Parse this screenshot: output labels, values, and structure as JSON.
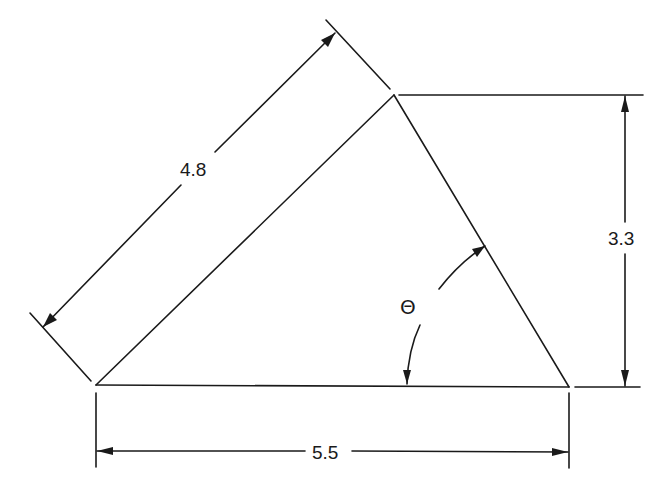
{
  "diagram": {
    "type": "triangle-dimension-drawing",
    "vertices": {
      "A": {
        "x": 96,
        "y": 385
      },
      "B": {
        "x": 394,
        "y": 95
      },
      "C": {
        "x": 569,
        "y": 387
      }
    },
    "dimensions": {
      "slant_side": {
        "label": "4.8",
        "between": [
          "A",
          "B"
        ]
      },
      "height": {
        "label": "3.3",
        "between": [
          "B",
          "base"
        ]
      },
      "base": {
        "label": "5.5",
        "between": [
          "A",
          "C"
        ]
      }
    },
    "angle": {
      "label": "Θ",
      "description": "angle between base AC and side BC",
      "vertex": "C"
    },
    "colors": {
      "line": "#1a1a1a",
      "background": "#ffffff"
    }
  }
}
